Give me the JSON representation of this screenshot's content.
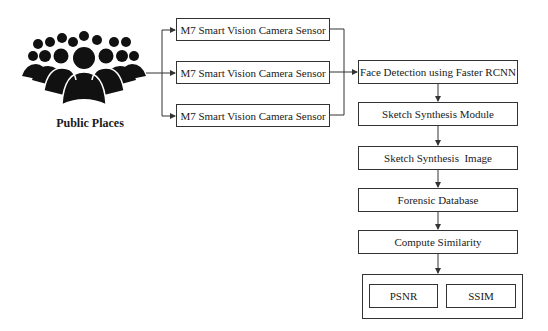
{
  "source": {
    "label": "Public Places",
    "icon": "crowd-icon"
  },
  "sensors": [
    {
      "label": "M7 Smart Vision Camera Sensor"
    },
    {
      "label": "M7 Smart Vision Camera Sensor"
    },
    {
      "label": "M7 Smart Vision Camera Sensor"
    }
  ],
  "pipeline": [
    {
      "label": "Face Detection using Faster RCNN"
    },
    {
      "label": "Sketch Synthesis Module"
    },
    {
      "label": "Sketch Synthesis  Image"
    },
    {
      "label": "Forensic Database"
    },
    {
      "label": "Compute Similarity"
    }
  ],
  "metrics": [
    {
      "label": "PSNR"
    },
    {
      "label": "SSIM"
    }
  ],
  "colors": {
    "line": "#333333",
    "icon": "#111111",
    "background": "#ffffff"
  }
}
